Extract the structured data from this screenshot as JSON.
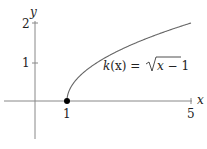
{
  "chart_data": {
    "type": "line",
    "title": "",
    "xlabel": "x",
    "ylabel": "y",
    "x_ticks": [
      "1",
      "5"
    ],
    "y_ticks": [
      "1",
      "2"
    ],
    "xlim": [
      -1,
      5.3
    ],
    "ylim": [
      -1,
      2.1
    ],
    "grid": false,
    "series": [
      {
        "name": "k(x) = √(x − 1)",
        "x": [
          1,
          1.25,
          1.5,
          2,
          2.5,
          3,
          3.5,
          4,
          4.5,
          5
        ],
        "y": [
          0,
          0.5,
          0.707,
          1,
          1.225,
          1.414,
          1.581,
          1.732,
          1.871,
          2
        ]
      }
    ],
    "annotations": [
      {
        "text": "k(x) = √(x − 1)",
        "x": 3.3,
        "y": 0.8
      },
      {
        "type": "point",
        "filled": true,
        "x": 1,
        "y": 0
      }
    ],
    "labels": {
      "x_axis": "x",
      "y_axis": "y",
      "tick_x1": "1",
      "tick_x5": "5",
      "tick_y1": "1",
      "tick_y2": "2",
      "func_k": "k",
      "func_rest": "(x) = ",
      "sqrt_body": "x − 1"
    }
  }
}
